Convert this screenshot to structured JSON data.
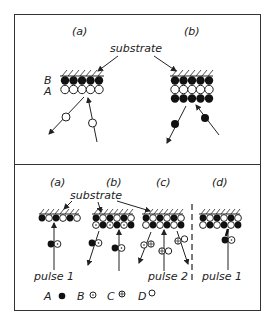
{
  "top_panel": {
    "labels": {
      "a": "(a)",
      "b": "(b)"
    },
    "substrate_label": "substrate",
    "layer_labels": {
      "B": "B",
      "A": "A"
    }
  },
  "bottom_panel": {
    "labels": {
      "a": "(a)",
      "b": "(b)",
      "c": "(c)",
      "d": "(d)"
    },
    "substrate_label": "substrate",
    "pulse_labels": {
      "a": "pulse 1",
      "c": "pulse 2",
      "d": "pulse 1"
    },
    "legend": [
      {
        "key": "A",
        "symbol": "filled-circle"
      },
      {
        "key": "B",
        "symbol": "dotted-circle"
      },
      {
        "key": "C",
        "symbol": "crossed-circle"
      },
      {
        "key": "D",
        "symbol": "open-circle"
      }
    ]
  },
  "colors": {
    "ink": "#222222",
    "background": "#ffffff"
  }
}
